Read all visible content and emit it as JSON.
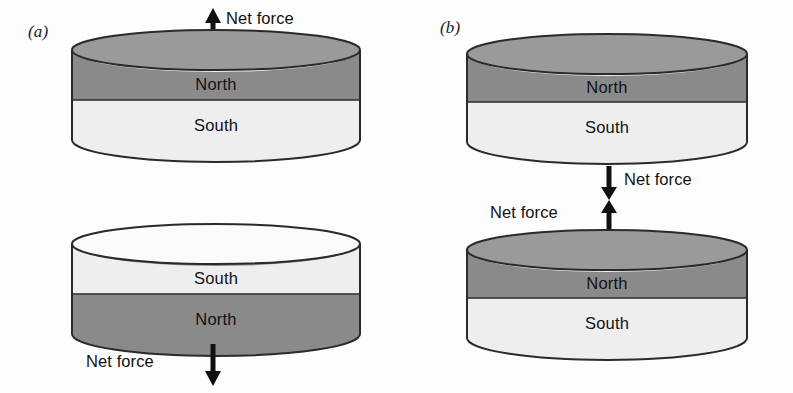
{
  "figure": {
    "background_color": "#fdfdfd",
    "width": 793,
    "height": 393,
    "ink_color": "#121212"
  },
  "colors": {
    "north_band": "#8a8a8a",
    "south_band": "#eeeeee",
    "top_face_north": "#9a9a9a",
    "top_face_south": "#fbfbfb",
    "outline": "#2a2a2a",
    "arrow": "#101010"
  },
  "panels": [
    {
      "id": "panel-a",
      "label": "(a)",
      "caption_note": "Like poles facing each other: magnets repel",
      "magnets": [
        {
          "id": "a-upper",
          "top_pole": "North",
          "bottom_pole": "South",
          "upper_band_label": "North",
          "lower_band_label": "South",
          "top_face_shade": "north"
        },
        {
          "id": "a-lower",
          "top_pole": "South",
          "bottom_pole": "North",
          "upper_band_label": "South",
          "lower_band_label": "North",
          "top_face_shade": "south"
        }
      ],
      "forces": [
        {
          "id": "a-force-top",
          "label": "Net force",
          "direction": "up",
          "label_side": "right"
        },
        {
          "id": "a-force-bottom",
          "label": "Net force",
          "direction": "down",
          "label_side": "left"
        }
      ]
    },
    {
      "id": "panel-b",
      "label": "(b)",
      "caption_note": "Opposite poles facing each other: magnets attract",
      "magnets": [
        {
          "id": "b-upper",
          "top_pole": "North",
          "bottom_pole": "South",
          "upper_band_label": "North",
          "lower_band_label": "South",
          "top_face_shade": "north"
        },
        {
          "id": "b-lower",
          "top_pole": "North",
          "bottom_pole": "South",
          "upper_band_label": "North",
          "lower_band_label": "South",
          "top_face_shade": "north"
        }
      ],
      "forces": [
        {
          "id": "b-force-upper",
          "label": "Net force",
          "direction": "down",
          "label_side": "right"
        },
        {
          "id": "b-force-lower",
          "label": "Net force",
          "direction": "up",
          "label_side": "left"
        }
      ]
    }
  ]
}
